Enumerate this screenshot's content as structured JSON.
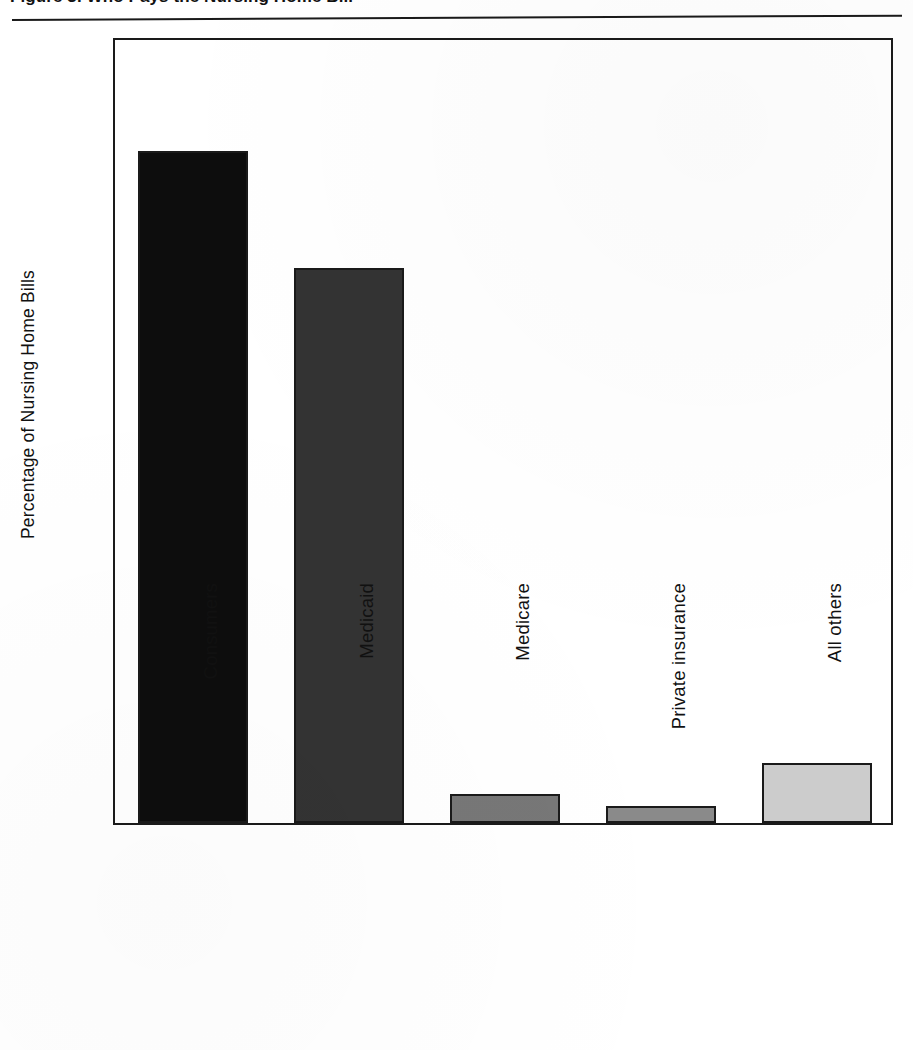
{
  "header": {
    "caption_partial": "Figure 3. Who Pays the Nursing Home Bill",
    "rule": "header-divider"
  },
  "chart_data": {
    "type": "bar",
    "title": "",
    "xlabel": "",
    "ylabel": "Percentage of Nursing Home Bills",
    "categories": [
      "Consumers",
      "Medicaid",
      "Medicare",
      "Private insurance",
      "All others"
    ],
    "values": [
      51.2,
      42.3,
      2.2,
      1.3,
      4.6
    ],
    "bar_colors": [
      "#0d0d0d",
      "#333333",
      "#777777",
      "#8a8a8a",
      "#cccccc"
    ],
    "bar_edge_color": "#1a1a1a",
    "ylim": [
      0,
      60
    ],
    "yticks": [
      0,
      10,
      20,
      30,
      40,
      50,
      60
    ],
    "ytick_labels": [
      "0",
      "10",
      "20",
      "30",
      "40",
      "50",
      "60"
    ],
    "grid": false,
    "legend": false,
    "legend_position": "none"
  },
  "axes": {
    "y_title": "Percentage of Nursing Home Bills",
    "frame_color": "#1a1a1a"
  },
  "colors": {
    "background": "#ffffff",
    "ink": "#111111",
    "frame": "#1a1a1a"
  }
}
